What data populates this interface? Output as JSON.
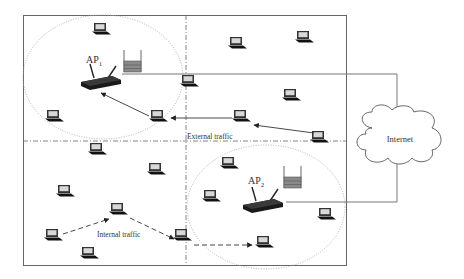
{
  "diagram": {
    "labels": {
      "ap1": "AP",
      "ap1_sub": "1",
      "ap2": "AP",
      "ap2_sub": "2",
      "internet": "Internet",
      "external_traffic": "External traffic",
      "internal_traffic": "Internal traffic"
    },
    "icons": {
      "laptop": "laptop-icon",
      "router": "wireless-router-icon",
      "queue": "packet-queue-icon",
      "cloud": "internet-cloud-icon"
    },
    "colors": {
      "border": "#555555",
      "line": "#444444",
      "coverage": "#aaaaaa",
      "queue_fill": "#8a8a8a",
      "device": "#222222"
    }
  }
}
